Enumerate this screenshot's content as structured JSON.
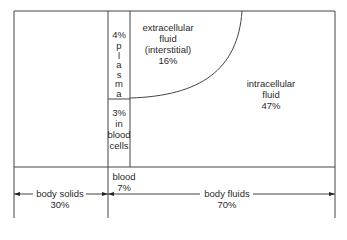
{
  "diagram": {
    "compartments": {
      "plasma": {
        "percent": "4%",
        "label_letters": [
          "p",
          "l",
          "a",
          "s",
          "m",
          "a"
        ]
      },
      "blood_cells": {
        "percent": "3%",
        "line2": "in",
        "line3": "blood",
        "line4": "cells"
      },
      "extracellular": {
        "line1": "extracellular",
        "line2": "fluid",
        "line3": "(interstitial)",
        "percent": "16%"
      },
      "intracellular": {
        "line1": "intracellular",
        "line2": "fluid",
        "percent": "47%"
      }
    },
    "dimensions": {
      "blood": {
        "label": "blood",
        "percent": "7%"
      },
      "body_solids": {
        "label": "body solids",
        "percent": "30%"
      },
      "body_fluids": {
        "label": "body fluids",
        "percent": "70%"
      }
    }
  }
}
